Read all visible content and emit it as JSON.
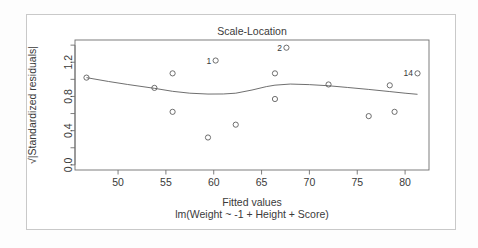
{
  "chart_data": {
    "type": "scatter",
    "title": "Scale-Location",
    "xlabel": "Fitted values",
    "sublabel": "lm(Weight ~ -1 + Height + Score)",
    "ylabel": "√|Standardized residuals|",
    "xlim": [
      45.5,
      82.5
    ],
    "ylim": [
      -0.06,
      1.46
    ],
    "xticks": [
      50,
      55,
      60,
      65,
      70,
      75,
      80
    ],
    "xtick_labels": [
      "50",
      "55",
      "60",
      "65",
      "70",
      "75",
      "80"
    ],
    "yticks": [
      0.0,
      0.4,
      0.8,
      1.2
    ],
    "ytick_labels": [
      "0.0",
      "0.4",
      "0.8",
      "1.2"
    ],
    "yminor": [
      0.2,
      0.6,
      1.0,
      1.4
    ],
    "grid": false,
    "legend": null,
    "point_color": "#555555",
    "line_color": "#555555",
    "frame_color": "#6f6f6f",
    "points": [
      {
        "x": 46.7,
        "y": 1.02,
        "label": null
      },
      {
        "x": 53.8,
        "y": 0.9,
        "label": null
      },
      {
        "x": 55.7,
        "y": 1.07,
        "label": null
      },
      {
        "x": 55.7,
        "y": 0.62,
        "label": null
      },
      {
        "x": 59.4,
        "y": 0.32,
        "label": null
      },
      {
        "x": 60.2,
        "y": 1.22,
        "label": "1"
      },
      {
        "x": 62.3,
        "y": 0.47,
        "label": null
      },
      {
        "x": 66.4,
        "y": 1.07,
        "label": null
      },
      {
        "x": 66.4,
        "y": 0.77,
        "label": null
      },
      {
        "x": 67.6,
        "y": 1.37,
        "label": "2"
      },
      {
        "x": 72.0,
        "y": 0.94,
        "label": null
      },
      {
        "x": 76.2,
        "y": 0.57,
        "label": null
      },
      {
        "x": 78.4,
        "y": 0.93,
        "label": null
      },
      {
        "x": 78.9,
        "y": 0.62,
        "label": null
      },
      {
        "x": 81.3,
        "y": 1.07,
        "label": "14"
      }
    ],
    "loess": [
      {
        "x": 46.7,
        "y": 1.02
      },
      {
        "x": 49.0,
        "y": 0.975
      },
      {
        "x": 51.0,
        "y": 0.94
      },
      {
        "x": 53.8,
        "y": 0.895
      },
      {
        "x": 55.7,
        "y": 0.86
      },
      {
        "x": 57.5,
        "y": 0.838
      },
      {
        "x": 59.4,
        "y": 0.828
      },
      {
        "x": 61.0,
        "y": 0.829
      },
      {
        "x": 62.3,
        "y": 0.838
      },
      {
        "x": 64.0,
        "y": 0.875
      },
      {
        "x": 65.5,
        "y": 0.915
      },
      {
        "x": 66.4,
        "y": 0.932
      },
      {
        "x": 68.0,
        "y": 0.945
      },
      {
        "x": 70.0,
        "y": 0.938
      },
      {
        "x": 72.0,
        "y": 0.925
      },
      {
        "x": 74.0,
        "y": 0.905
      },
      {
        "x": 76.2,
        "y": 0.882
      },
      {
        "x": 78.4,
        "y": 0.857
      },
      {
        "x": 80.0,
        "y": 0.838
      },
      {
        "x": 81.3,
        "y": 0.825
      }
    ]
  }
}
